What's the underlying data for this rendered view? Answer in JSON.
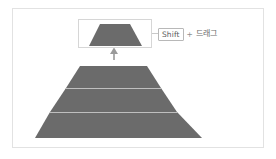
{
  "figure": {
    "kind": "diagram",
    "background_color": "#ffffff",
    "frame_color": "#e2e2e2"
  },
  "shape_colors": {
    "fill": "#6b6b6b",
    "divider": "#bfbfbf",
    "selection_border": "#d6d6d6",
    "arrow": "#9a9a9a",
    "leader_line": "#c9c9c9",
    "keycap_border": "#b8b8b8",
    "keycap_text": "#5a5a5a",
    "label_text": "#6d6d6d",
    "plus_text": "#8f8f8f"
  },
  "detached_slice": {
    "name": "top-slice",
    "selected": true,
    "selection_box": {
      "x": 78,
      "y": 19,
      "width": 74,
      "height": 29
    },
    "trapezoid": {
      "top_left": 100,
      "top_right": 130,
      "top_y": 24,
      "bottom_left": 89,
      "bottom_right": 142,
      "bottom_y": 46
    }
  },
  "move_arrow": {
    "name": "up-arrow",
    "direction": "up",
    "x": 114,
    "from_y": 60,
    "to_y": 48
  },
  "pyramid": {
    "name": "pyramid-chart",
    "apex_x": 114,
    "top_y": 66,
    "base_y": 138,
    "top_left": 80,
    "top_right": 147,
    "base_left": 35,
    "base_right": 202,
    "bands": [
      {
        "name": "band-top",
        "top_y": 66,
        "bottom_y": 88
      },
      {
        "name": "band-middle",
        "top_y": 88,
        "bottom_y": 112
      },
      {
        "name": "band-bottom",
        "top_y": 112,
        "bottom_y": 138
      }
    ],
    "divider_y": [
      88,
      112
    ]
  },
  "callout": {
    "key_label": "Shift",
    "separator": "+",
    "action_label": "드래그"
  }
}
